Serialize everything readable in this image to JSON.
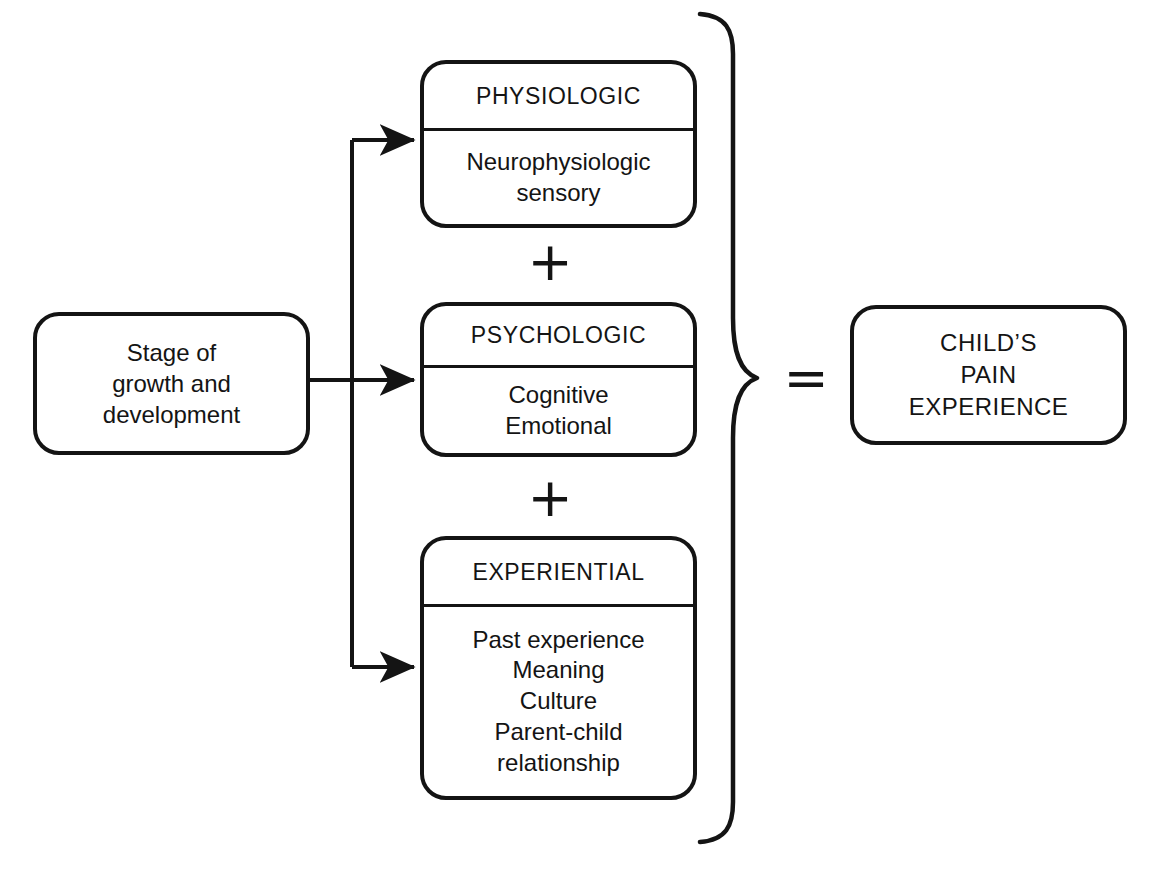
{
  "diagram": {
    "colors": {
      "stroke": "#141414",
      "background": "#ffffff",
      "text": "#141414"
    },
    "input": {
      "label": "Stage of\ngrowth and\ndevelopment"
    },
    "components": [
      {
        "header": "PHYSIOLOGIC",
        "body": "Neurophysiologic\nsensory"
      },
      {
        "header": "PSYCHOLOGIC",
        "body": "Cognitive\nEmotional"
      },
      {
        "header": "EXPERIENTIAL",
        "body": "Past experience\nMeaning\nCulture\nParent-child\nrelationship"
      }
    ],
    "operators": {
      "plus_first": "+",
      "plus_second": "+",
      "equals": "="
    },
    "result": {
      "label": "CHILD’S\nPAIN\nEXPERIENCE"
    },
    "connectors": {
      "brace": "right-curly-brace",
      "arrow_to_physiologic": "arrow-right",
      "arrow_to_psychologic": "arrow-right",
      "arrow_to_experiential": "arrow-right"
    }
  }
}
